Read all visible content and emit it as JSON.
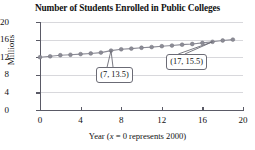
{
  "chart_data": {
    "type": "line",
    "title": "Number of Students Enrolled in Public Colleges",
    "xlabel": "Year (x = 0 represents 2000)",
    "xlabel_parts": {
      "pre": "Year (",
      "ital": "x",
      "post": " = 0 represents 2000)"
    },
    "ylabel": "Millions",
    "xlim": [
      0,
      20
    ],
    "ylim": [
      0,
      20
    ],
    "xticks": [
      0,
      4,
      8,
      12,
      16,
      20
    ],
    "yticks": [
      0,
      4,
      8,
      12,
      16,
      20
    ],
    "xtick_labels": [
      "0",
      "4",
      "8",
      "12",
      "16",
      "20"
    ],
    "ytick_labels": [
      "0",
      "4",
      "8",
      "12",
      "16",
      "20"
    ],
    "grid": "horizontal",
    "legend": "none",
    "series": [
      {
        "name": "Public college enrollment",
        "marker": "circle",
        "color": "#8c8c96",
        "x": [
          0,
          1,
          2,
          3,
          4,
          5,
          6,
          7,
          8,
          9,
          10,
          11,
          12,
          13,
          14,
          15,
          16,
          17,
          18,
          19
        ],
        "values": [
          12.0,
          12.2,
          12.45,
          12.55,
          12.7,
          12.85,
          13.05,
          13.5,
          13.8,
          13.95,
          14.15,
          14.3,
          14.5,
          14.65,
          14.85,
          15.0,
          15.25,
          15.5,
          15.8,
          16.0
        ]
      }
    ],
    "annotations": [
      {
        "label": "(7, 13.5)",
        "x": 7,
        "y": 13.5
      },
      {
        "label": "(17, 15.5)",
        "x": 17,
        "y": 15.5
      }
    ]
  }
}
